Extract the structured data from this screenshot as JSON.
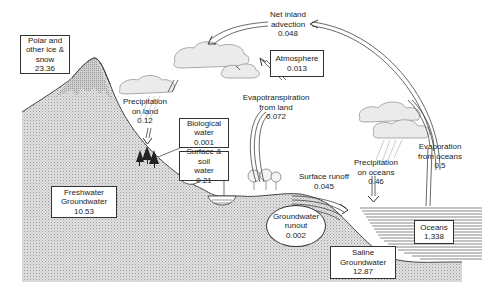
{
  "reservoirs": {
    "polar_ice": {
      "line1": "Polar and",
      "line2": "other ice &",
      "line3": "snow",
      "value": "23.36"
    },
    "atmosphere": {
      "line1": "Atmosphere",
      "value": "0.013"
    },
    "biological_water": {
      "line1": "Biological",
      "line2": "water",
      "value": "0.001"
    },
    "surface_soil_water": {
      "line1": "Surface & soil",
      "line2": "water",
      "value": "0.21"
    },
    "freshwater_groundwater": {
      "line1": "Freshwater",
      "line2": "Groundwater",
      "value": "10.53"
    },
    "groundwater_runout": {
      "line1": "Groundwater",
      "line2": "runout",
      "value": "0.002"
    },
    "oceans": {
      "line1": "Oceans",
      "value": "1,338"
    },
    "saline_groundwater": {
      "line1": "Saline",
      "line2": "Groundwater",
      "value": "12.87"
    }
  },
  "fluxes": {
    "net_inland_advection": {
      "line1": "Net inland",
      "line2": "advection",
      "value": "0.048"
    },
    "precipitation_on_land": {
      "line1": "Precipitation",
      "line2": "on land",
      "value": "0.12"
    },
    "evapotranspiration": {
      "line1": "Evapotranspiration",
      "line2": "from land",
      "value": "0.072"
    },
    "surface_runoff": {
      "line1": "Surface runoff",
      "value": "0.045"
    },
    "precipitation_on_oceans": {
      "line1": "Precipitation",
      "line2": "on oceans",
      "value": "0.46"
    },
    "evaporation_from_oceans": {
      "line1": "Evaporation",
      "line2": "from oceans",
      "value": "0.5"
    }
  },
  "colors": {
    "line": "#333333",
    "land_fill": "#d4d4d4",
    "ocean_line": "#555555",
    "cloud": "#e8e8e8"
  }
}
